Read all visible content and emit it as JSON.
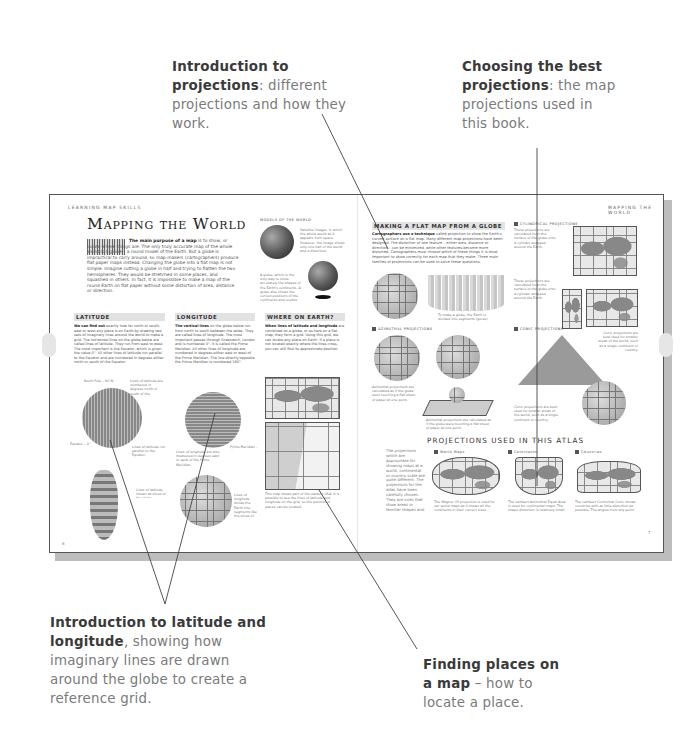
{
  "callouts": {
    "projections_intro": {
      "bold": "Introduction to projections",
      "rest": ": different projections and how they work."
    },
    "choosing_best": {
      "bold": "Choosing the best projections",
      "rest": ": the map projections used in this book."
    },
    "latitude_longitude": {
      "bold": "Introduction to latitude and longitude",
      "rest": ", showing how imaginary lines are drawn around the globe to create a reference grid."
    },
    "finding_places": {
      "bold": "Finding places on a map",
      "rest": " – how to locate a place."
    }
  },
  "spread": {
    "left_page": {
      "running_head": "LEARNING MAP SKILLS",
      "title": "Mapping the World",
      "intro_bold": "The main purpose of a map",
      "intro_text": " is to show, or locate where things are. The only truly accurate map of the whole world is a globe – a round model of the Earth. But a globe is impractical to carry around, so map-makers (cartographers) produce flat paper maps instead. Changing the globe into a flat map is not simple. Imagine cutting a globe in half and trying to flatten the two hemispheres. They would be stretched in some places, and squashed in others. In fact, it is impossible to make a map of the round Earth on flat paper without some distortion of area, distance or direction.",
      "models_head": "MODELS OF THE WORLD",
      "models_caption_1": "Satellite images, in which the whole world as it appears from space. However, the image shows only one half of the world and a distortion.",
      "models_caption_2": "A globe, which is the only way to show accurately the shapes of the Earth's continents. A globe also shows the correct positions of the continents and oceans relative to each other.",
      "sections": [
        {
          "heading": "LATITUDE",
          "lead": "We can find out",
          "text": " exactly how far north or south, east or west any place is on Earth by drawing two sets of imaginary lines around the world to make a grid. The horizontal lines on the globe below are called lines of latitude. They run from east to west. The most important is the Equator, which is given the value 0°. All other lines of latitude run parallel to the Equator and are numbered in degrees either north or south of the Equator."
        },
        {
          "heading": "LONGITUDE",
          "lead": "The vertical lines",
          "text": " on the globe below run from north to south between the poles. They are called lines of longitude. The most important passes through Greenwich, London and is numbered 0°. It is called the Prime Meridian. All other lines of longitude are numbered in degrees either east or west of the Prime Meridian. The line directly opposite the Prime Meridian is numbered 180°."
        },
        {
          "heading": "WHERE ON EARTH?",
          "lead": "When lines of latitude and longitude",
          "text": " are combined on a globe, or as here on a flat map, they form a grid. Using this grid, we can locate any place on Earth. If a place is not located exactly where the lines cross, you can still find its approximate position."
        }
      ],
      "lat_captions": [
        "North Pole – 90°N",
        "Lines of latitude are numbered in degrees north or south of the Equator.",
        "Equator – 0°",
        "Lines of latitude run parallel to the Equator.",
        "Lines of latitude shown as slices of the globe."
      ],
      "lon_captions": [
        "Lines of longitude are also measured in degrees east or west of the Prime Meridian.",
        "Prime Meridian – 0°",
        "Lines of longitude divide the Earth into segments like the slices of an orange."
      ],
      "where_caption": "This map shows part of the eastern USA. It is possible to see the lines of latitude and longitude on the grid, so the position of places can be located.",
      "page_number": "6"
    },
    "right_page": {
      "running_head": "MAPPING THE WORLD",
      "main_heading": "MAKING A FLAT MAP FROM A GLOBE",
      "lead": "Cartographers use a technique",
      "text": " called projection to show the Earth's curved surface on a flat map. Many different map projections have been designed. The distortion of one feature – either area, distance or direction – can be minimized, while other features become more distorted. Cartographers must choose which of these things it is most important to show correctly for each map that they make. Three main families of projections can be used to solve these questions.",
      "gores_caption": "To make a globe, the Earth is divided into segments (gores) which are then joined.",
      "families": [
        {
          "heading": "CYLINDRICAL PROJECTIONS",
          "caption": "These projections are calculated from the surface of the globe onto a cylinder wrapped around the Earth."
        },
        {
          "heading": "AZIMUTHAL PROJECTIONS",
          "caption": "Azimuthal projections are calculated as if the globe were touching a flat sheet of paper at one point."
        },
        {
          "heading": "CONIC PROJECTIONS",
          "caption": "Conic projections are best used for smaller areas of the world, such as a single continent or country."
        }
      ],
      "atlas_heading": "PROJECTIONS USED IN THIS ATLAS",
      "atlas_intro": "The projections which are appropriate for showing maps at a world, continental or country scale are quite different. The projections for the atlas have been carefully chosen. They are ones that show areas in familiar shapes and ensure that they are distorted as little as possible.",
      "atlas_projections": [
        {
          "label": "World Maps",
          "caption": "The Wagner VII projection is used for our world maps as it shows all the continents in their correct sizes relative to one another."
        },
        {
          "label": "Continents",
          "caption": "The Lambert Azimuthal Equal Area is used for continental maps. The shape distortion is relatively small and countries retain their correct sizes relative to one another."
        },
        {
          "label": "Countries",
          "caption": "The Lambert Conformal Conic shows countries with as little distortion as possible. The angles from any point on the map are the same as they would be on the surface of the globe."
        }
      ],
      "page_number": "7"
    }
  }
}
